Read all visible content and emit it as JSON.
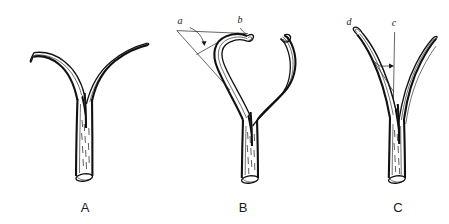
{
  "figure": {
    "background_color": "#ffffff",
    "ink_color": "#111111",
    "caption_style": "scientific line drawing",
    "panels": [
      {
        "id": "A",
        "label": "A",
        "label_x": 85,
        "label_y": 212,
        "description": "Forked tubular structure: straight vertical stem splitting into two smooth curved branches, left branch shorter with a cut open tip, right branch longer and sweeping upward to the right.",
        "annotations": []
      },
      {
        "id": "B",
        "label": "B",
        "label_x": 243,
        "label_y": 212,
        "description": "Forked tubular structure with two tall recurved branches forming a lyre shape; both tips hook inward. Angle annotation drawn at upper left.",
        "annotations": [
          {
            "id": "a",
            "label": "a",
            "x": 180,
            "y": 24,
            "kind": "angle-vertex-label"
          },
          {
            "id": "b",
            "label": "b",
            "x": 240,
            "y": 23,
            "kind": "branch-tip-label"
          }
        ]
      },
      {
        "id": "C",
        "label": "C",
        "label_x": 398,
        "label_y": 212,
        "description": "Narrow forked tubular structure with closely set branches; vertical reference line with angle arrow at right, left branch tip labelled.",
        "annotations": [
          {
            "id": "d",
            "label": "d",
            "x": 349,
            "y": 25,
            "kind": "branch-tip-label"
          },
          {
            "id": "c",
            "label": "c",
            "x": 394,
            "y": 26,
            "kind": "reference-line-label"
          }
        ]
      }
    ]
  }
}
